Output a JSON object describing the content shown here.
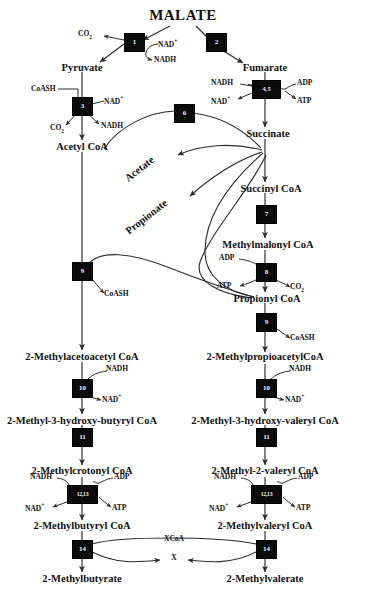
{
  "diagram": {
    "title": "MALATE",
    "type": "metabolic-pathway"
  },
  "metabolites": {
    "malate": "MALATE",
    "pyruvate": "Pyruvate",
    "fumarate": "Fumarate",
    "acetyl_coa": "Acetyl CoA",
    "succinate": "Succinate",
    "acetate": "Acetate",
    "propionate": "Propionate",
    "succinyl_coa": "Succinyl CoA",
    "methylmalonyl_coa": "Methylmalonyl CoA",
    "propionyl_coa": "Propionyl CoA",
    "methylacetoacetyl_coa": "2-Methylacetoacetyl CoA",
    "methylpropioacetyl_coa": "2-MethylpropioacetylCoA",
    "methyl_hydroxy_butyryl_coa": "2-Methyl-3-hydroxy-butyryl CoA",
    "methyl_hydroxy_valeryl_coa": "2-Methyl-3-hydroxy-valeryl CoA",
    "methylcrotonyl_coa": "2-Methylcrotonyl CoA",
    "methyl_2_valeryl_coa": "2-Methyl-2-valeryl CoA",
    "methylbutyryl_coa": "2-Methylbutyryl CoA",
    "methylvaleryl_coa": "2-Methylvaleryl CoA",
    "methylbutyrate": "2-Methylbutyrate",
    "methylvalerate": "2-Methylvalerate"
  },
  "cofactors": {
    "co2_1": "CO",
    "co2_sub": "2",
    "nad_plus": "NAD",
    "nad_sup": "+",
    "nadh": "NADH",
    "coash": "CoASH",
    "adp": "ADP",
    "atp": "ATP",
    "xcoa": "XCoA",
    "x": "X"
  },
  "enzyme_boxes": [
    {
      "id": "1",
      "label": "1",
      "x": 124,
      "y": 33,
      "w": 19,
      "h": 17
    },
    {
      "id": "2",
      "label": "2",
      "x": 206,
      "y": 33,
      "w": 19,
      "h": 17
    },
    {
      "id": "3",
      "label": "3",
      "x": 72,
      "y": 97,
      "w": 19,
      "h": 17
    },
    {
      "id": "4,5",
      "label": "4, 5",
      "x": 252,
      "y": 80,
      "w": 27,
      "h": 17
    },
    {
      "id": "6",
      "label": "6",
      "x": 174,
      "y": 108,
      "w": 19,
      "h": 17
    },
    {
      "id": "7",
      "label": "7",
      "x": 256,
      "y": 205,
      "w": 19,
      "h": 17
    },
    {
      "id": "8",
      "label": "8",
      "x": 256,
      "y": 263,
      "w": 19,
      "h": 17
    },
    {
      "id": "9L",
      "label": "9",
      "x": 72,
      "y": 262,
      "w": 19,
      "h": 17
    },
    {
      "id": "9R",
      "label": "9",
      "x": 256,
      "y": 313,
      "w": 19,
      "h": 17
    },
    {
      "id": "10L",
      "label": "10",
      "x": 72,
      "y": 379,
      "w": 19,
      "h": 17
    },
    {
      "id": "10R",
      "label": "10",
      "x": 256,
      "y": 379,
      "w": 19,
      "h": 17
    },
    {
      "id": "11L",
      "label": "11",
      "x": 72,
      "y": 428,
      "w": 19,
      "h": 17
    },
    {
      "id": "11R",
      "label": "11",
      "x": 256,
      "y": 428,
      "w": 19,
      "h": 17
    },
    {
      "id": "12,13L",
      "label": "12,13",
      "x": 67,
      "y": 485,
      "w": 29,
      "h": 17
    },
    {
      "id": "12,13R",
      "label": "12,13",
      "x": 251,
      "y": 485,
      "w": 29,
      "h": 17
    },
    {
      "id": "14L",
      "label": "14",
      "x": 72,
      "y": 540,
      "w": 19,
      "h": 17
    },
    {
      "id": "14R",
      "label": "14",
      "x": 256,
      "y": 540,
      "w": 19,
      "h": 17
    }
  ],
  "colors": {
    "box_fill": "#0b0b0b",
    "box_text": "#ffffff",
    "line": "#2b2b2b",
    "text": "#111111",
    "background": "#ffffff"
  }
}
